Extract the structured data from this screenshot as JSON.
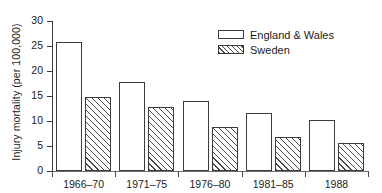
{
  "chart_data": {
    "type": "bar",
    "title": "",
    "xlabel": "",
    "ylabel": "Injury mortality (per 100,000)",
    "categories": [
      "1966–70",
      "1971–75",
      "1976–80",
      "1981–85",
      "1988"
    ],
    "series": [
      {
        "name": "England & Wales",
        "values": [
          25.8,
          17.8,
          14.0,
          11.6,
          10.2
        ],
        "fill": "white",
        "pattern": "solid-outline"
      },
      {
        "name": "Sweden",
        "values": [
          14.9,
          12.8,
          8.8,
          6.8,
          5.7
        ],
        "fill": "white",
        "pattern": "diagonal-hatch"
      }
    ],
    "ylim": [
      0,
      30
    ],
    "yticks": [
      0,
      5,
      10,
      15,
      20,
      25,
      30
    ],
    "ytick_labels": [
      "0",
      "5",
      "10",
      "15",
      "20",
      "25",
      "30"
    ],
    "grid": false,
    "legend_position": "top-right",
    "colors": {
      "axis": "#3a3a3a",
      "bar_outline": "#3c3c3c",
      "hatch": "#4a4a4a",
      "text": "#1b1b1b",
      "background": "#ffffff"
    }
  },
  "legend": {
    "entries": [
      {
        "label": "England & Wales",
        "swatch": "open-rectangle-swatch"
      },
      {
        "label": "Sweden",
        "swatch": "hatched-rectangle-swatch"
      }
    ]
  }
}
